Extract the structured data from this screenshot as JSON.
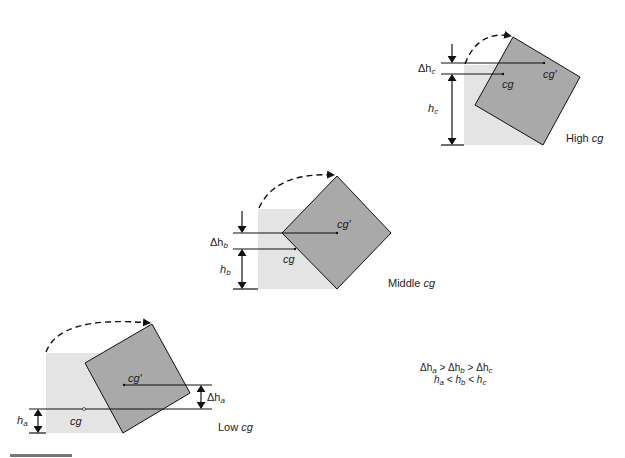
{
  "colors": {
    "base_block": "#e4e4e4",
    "tilted_block": "#a9a9a9",
    "stroke": "#111111",
    "text": "#222222"
  },
  "diagrams": [
    {
      "id": "high",
      "caption_prefix": "High ",
      "caption_var": "cg",
      "delta_label_sym": "Δh",
      "delta_label_sub": "c",
      "h_label_sym": "h",
      "h_label_sub": "c",
      "cg_label": "cg",
      "cg_prime_label": "cg'"
    },
    {
      "id": "middle",
      "caption_prefix": "Middle ",
      "caption_var": "cg",
      "delta_label_sym": "Δh",
      "delta_label_sub": "b",
      "h_label_sym": "h",
      "h_label_sub": "b",
      "cg_label": "cg",
      "cg_prime_label": "cg'"
    },
    {
      "id": "low",
      "caption_prefix": "Low ",
      "caption_var": "cg",
      "delta_label_sym": "Δh",
      "delta_label_sub": "a",
      "h_label_sym": "h",
      "h_label_sub": "a",
      "cg_label": "cg",
      "cg_prime_label": "cg'"
    }
  ],
  "relations": {
    "line1": {
      "d": "Δh",
      "a": "a",
      "gt1": " > ",
      "b": "b",
      "gt2": " > ",
      "c": "c"
    },
    "line2": {
      "h": "h",
      "a": "a",
      "lt1": " < ",
      "b": "b",
      "lt2": " < ",
      "c": "c"
    }
  }
}
